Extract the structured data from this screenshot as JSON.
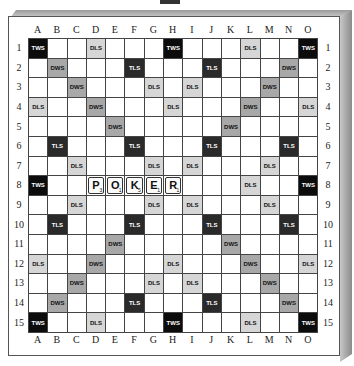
{
  "board": {
    "columns": [
      "A",
      "B",
      "C",
      "D",
      "E",
      "F",
      "G",
      "H",
      "I",
      "J",
      "K",
      "L",
      "M",
      "N",
      "O"
    ],
    "rows": [
      "1",
      "2",
      "3",
      "4",
      "5",
      "6",
      "7",
      "8",
      "9",
      "10",
      "11",
      "12",
      "13",
      "14",
      "15"
    ],
    "premium_labels": {
      "TWS": "TWS",
      "DWS": "DWS",
      "TLS": "TLS",
      "DLS": "DLS"
    },
    "colors": {
      "TWS": "#0c0c0c",
      "TLS": "#2a2a2a",
      "DWS": "#a8a8a8",
      "DLS": "#d6d6d6",
      "plain": "#ffffff"
    },
    "layout": [
      [
        "TWS",
        "",
        "",
        "DLS",
        "",
        "",
        "",
        "TWS",
        "",
        "",
        "",
        "DLS",
        "",
        "",
        "TWS"
      ],
      [
        "",
        "DWS",
        "",
        "",
        "",
        "TLS",
        "",
        "",
        "",
        "TLS",
        "",
        "",
        "",
        "DWS",
        ""
      ],
      [
        "",
        "",
        "DWS",
        "",
        "",
        "",
        "DLS",
        "",
        "DLS",
        "",
        "",
        "",
        "DWS",
        "",
        ""
      ],
      [
        "DLS",
        "",
        "",
        "DWS",
        "",
        "",
        "",
        "DLS",
        "",
        "",
        "",
        "DWS",
        "",
        "",
        "DLS"
      ],
      [
        "",
        "",
        "",
        "",
        "DWS",
        "",
        "",
        "",
        "",
        "",
        "DWS",
        "",
        "",
        "",
        ""
      ],
      [
        "",
        "TLS",
        "",
        "",
        "",
        "TLS",
        "",
        "",
        "",
        "TLS",
        "",
        "",
        "",
        "TLS",
        ""
      ],
      [
        "",
        "",
        "DLS",
        "",
        "",
        "",
        "DLS",
        "",
        "DLS",
        "",
        "",
        "",
        "DLS",
        "",
        ""
      ],
      [
        "TWS",
        "",
        "",
        "",
        "",
        "",
        "",
        "",
        "",
        "",
        "",
        "DLS",
        "",
        "",
        "TWS"
      ],
      [
        "",
        "",
        "DLS",
        "",
        "",
        "",
        "DLS",
        "",
        "DLS",
        "",
        "",
        "",
        "DLS",
        "",
        ""
      ],
      [
        "",
        "TLS",
        "",
        "",
        "",
        "TLS",
        "",
        "",
        "",
        "TLS",
        "",
        "",
        "",
        "TLS",
        ""
      ],
      [
        "",
        "",
        "",
        "",
        "DWS",
        "",
        "",
        "",
        "",
        "",
        "DWS",
        "",
        "",
        "",
        ""
      ],
      [
        "DLS",
        "",
        "",
        "DWS",
        "",
        "",
        "",
        "DLS",
        "",
        "",
        "",
        "DWS",
        "",
        "",
        "DLS"
      ],
      [
        "",
        "",
        "DWS",
        "",
        "",
        "",
        "DLS",
        "",
        "DLS",
        "",
        "",
        "",
        "DWS",
        "",
        ""
      ],
      [
        "",
        "DWS",
        "",
        "",
        "",
        "TLS",
        "",
        "",
        "",
        "TLS",
        "",
        "",
        "",
        "DWS",
        ""
      ],
      [
        "TWS",
        "",
        "",
        "DLS",
        "",
        "",
        "",
        "TWS",
        "",
        "",
        "",
        "DLS",
        "",
        "",
        "TWS"
      ]
    ],
    "tiles": [
      {
        "row": 8,
        "col": "D",
        "letter": "P",
        "points": "3"
      },
      {
        "row": 8,
        "col": "E",
        "letter": "O",
        "points": "1"
      },
      {
        "row": 8,
        "col": "F",
        "letter": "K",
        "points": "5"
      },
      {
        "row": 8,
        "col": "G",
        "letter": "E",
        "points": "1"
      },
      {
        "row": 8,
        "col": "H",
        "letter": "R",
        "points": "1"
      }
    ],
    "word_played": "POKER"
  }
}
